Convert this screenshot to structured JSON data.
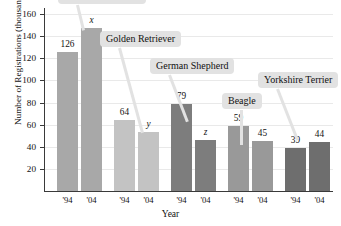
{
  "chart_data": {
    "type": "bar",
    "title": "",
    "xlabel": "Year",
    "ylabel": "Number of Registrations (thousands)",
    "ylim": [
      0,
      160
    ],
    "yticks": [
      20,
      40,
      60,
      80,
      100,
      120,
      140,
      160
    ],
    "ytick_labels": [
      "20",
      "40",
      "60",
      "80",
      "100",
      "120",
      "140",
      "160"
    ],
    "grid": true,
    "legend": "none",
    "categories": [
      "'94",
      "'04",
      "'94",
      "'04",
      "'94",
      "'04",
      "'94",
      "'04",
      "'94",
      "'04"
    ],
    "groups": [
      {
        "name": "Labrador Retriever",
        "label_visible": false,
        "color": "#a8a8a8",
        "bars": [
          {
            "year": "'94",
            "value": 126,
            "label": "126",
            "unknown": false
          },
          {
            "year": "'04",
            "value": 147,
            "label": "x",
            "unknown": true
          }
        ]
      },
      {
        "name": "Golden Retriever",
        "label_visible": true,
        "color": "#c3c3c3",
        "bars": [
          {
            "year": "'94",
            "value": 64,
            "label": "64",
            "unknown": false
          },
          {
            "year": "'04",
            "value": 53,
            "label": "y",
            "unknown": true
          }
        ]
      },
      {
        "name": "German Shepherd",
        "label_visible": true,
        "color": "#7d7d7d",
        "bars": [
          {
            "year": "'94",
            "value": 79,
            "label": "79",
            "unknown": false
          },
          {
            "year": "'04",
            "value": 46,
            "label": "z",
            "unknown": true
          }
        ]
      },
      {
        "name": "Beagle",
        "label_visible": true,
        "color": "#999999",
        "bars": [
          {
            "year": "'94",
            "value": 59,
            "label": "59",
            "unknown": false
          },
          {
            "year": "'04",
            "value": 45,
            "label": "45",
            "unknown": false
          }
        ]
      },
      {
        "name": "Yorkshire Terrier",
        "label_visible": true,
        "color": "#6e6e6e",
        "bars": [
          {
            "year": "'94",
            "value": 39,
            "label": "39",
            "unknown": false
          },
          {
            "year": "'04",
            "value": 44,
            "label": "44",
            "unknown": false
          }
        ]
      }
    ],
    "callouts": [
      {
        "text": "Labrador Retriever",
        "clipped_top": true,
        "box_left": 58,
        "box_top": -12,
        "anchor_x": 82,
        "anchor_y": 30
      },
      {
        "text": "Golden Retriever",
        "clipped_top": false,
        "box_left": 100,
        "box_top": 31,
        "anchor_x": 141,
        "anchor_y": 133
      },
      {
        "text": "German Shepherd",
        "clipped_top": false,
        "box_left": 150,
        "box_top": 58,
        "anchor_x": 186,
        "anchor_y": 122
      },
      {
        "text": "Beagle",
        "clipped_top": false,
        "box_left": 222,
        "box_top": 93,
        "anchor_x": 240,
        "anchor_y": 145
      },
      {
        "text": "Yorkshire Terrier",
        "clipped_top": false,
        "box_left": 258,
        "box_top": 72,
        "anchor_x": 296,
        "anchor_y": 140
      }
    ],
    "colors": {
      "grid": "#e9e9e9",
      "axis": "#3a3a3a",
      "callout_bg": "#e2e2e2",
      "text": "#111111",
      "background": "#ffffff"
    }
  }
}
